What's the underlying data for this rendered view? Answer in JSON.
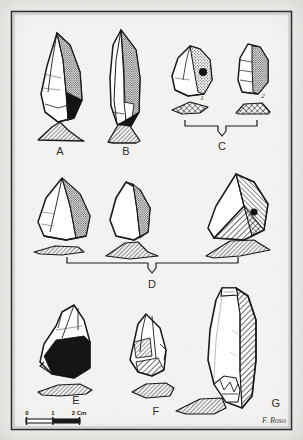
{
  "plate": {
    "kind": "archaeological-lithic-plate",
    "background_color": "#f4f2f0",
    "ink_color": "#1a1a1a",
    "frame": {
      "visible": true,
      "color": "#2a2a2a"
    },
    "artifact_labels": [
      {
        "id": "A",
        "text": "A",
        "x": 60,
        "y": 152
      },
      {
        "id": "B",
        "text": "B",
        "x": 126,
        "y": 152
      },
      {
        "id": "C",
        "text": "C",
        "x": 222,
        "y": 148
      },
      {
        "id": "D",
        "text": "D",
        "x": 152,
        "y": 285
      },
      {
        "id": "E",
        "text": "E",
        "x": 76,
        "y": 401
      },
      {
        "id": "F",
        "text": "F",
        "x": 156,
        "y": 412
      },
      {
        "id": "G",
        "text": "G",
        "x": 276,
        "y": 404
      }
    ],
    "sub_labels": [
      {
        "id": "c1",
        "text": "1",
        "x": 202,
        "y": 94
      },
      {
        "id": "c2",
        "text": "2",
        "x": 263,
        "y": 92
      }
    ],
    "group_brackets": [
      {
        "id": "bracket-c",
        "label": "C",
        "x1": 185,
        "x2": 257,
        "y": 125
      },
      {
        "id": "bracket-d",
        "label": "D",
        "x1": 67,
        "x2": 238,
        "y": 263
      }
    ],
    "scale_bar": {
      "ticks": [
        "0",
        "1",
        "2 Cm"
      ],
      "tick_values": [
        0,
        1,
        2
      ],
      "unit": "Cm",
      "x_start": 26,
      "x_end": 80,
      "y": 420
    },
    "signature": {
      "text": "F. Roso",
      "x": 274,
      "y": 423
    }
  }
}
